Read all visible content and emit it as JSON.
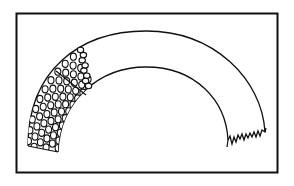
{
  "diagram": {
    "colors": {
      "stroke": "#111111",
      "background": "#ffffff"
    },
    "frame": {
      "x": 16,
      "y": 13,
      "width": 261,
      "height": 160
    },
    "elements": [
      {
        "name": "arch-band",
        "label": ""
      },
      {
        "name": "packed-circles-region",
        "label": ""
      },
      {
        "name": "single-circle-column",
        "label": ""
      },
      {
        "name": "frayed-end",
        "label": ""
      }
    ]
  }
}
